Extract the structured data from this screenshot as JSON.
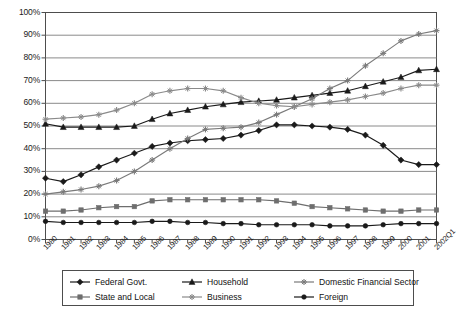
{
  "chart_data": {
    "type": "line",
    "title": "",
    "xlabel": "",
    "ylabel": "",
    "ylim": [
      0,
      100
    ],
    "ytick_labels": [
      "100%",
      "90%",
      "80%",
      "70%",
      "60%",
      "50%",
      "40%",
      "30%",
      "20%",
      "10%",
      "0%"
    ],
    "ytick_values": [
      100,
      90,
      80,
      70,
      60,
      50,
      40,
      30,
      20,
      10,
      0
    ],
    "grid": true,
    "legend_position": "bottom",
    "categories": [
      "1980",
      "1981",
      "1982",
      "1983",
      "1984",
      "1985",
      "1986",
      "1987",
      "1988",
      "1989",
      "1990",
      "1991",
      "1992",
      "1993",
      "1994",
      "1995",
      "1996",
      "1997",
      "1998",
      "1999",
      "2000",
      "2001",
      "2002Q1"
    ],
    "series": [
      {
        "name": "Federal Govt.",
        "marker": "diamond",
        "color": "#1a1a1a",
        "values": [
          27,
          25.5,
          28.5,
          32,
          35,
          38,
          41,
          42.5,
          43.5,
          44,
          44.5,
          46,
          48,
          50.5,
          50.5,
          50,
          49.5,
          48.5,
          46,
          41.5,
          35,
          33,
          33
        ]
      },
      {
        "name": "Household",
        "marker": "triangle",
        "color": "#1a1a1a",
        "values": [
          51,
          49.5,
          49.5,
          49.5,
          49.5,
          50,
          53,
          55.5,
          57,
          58.5,
          59.5,
          60.5,
          61,
          61.5,
          62.5,
          63.5,
          64.5,
          65.5,
          67.5,
          69.5,
          71.5,
          74.5,
          75
        ]
      },
      {
        "name": "Domestic Financial Sector",
        "marker": "star",
        "color": "#7a7a7a",
        "values": [
          20,
          21,
          22,
          23.5,
          26,
          30,
          35,
          40,
          44.5,
          48.5,
          49,
          49.5,
          51.5,
          55,
          58.5,
          62,
          66.5,
          70,
          76.5,
          82,
          87.5,
          90.5,
          92
        ]
      },
      {
        "name": "State and Local",
        "marker": "square",
        "color": "#6e6e6e",
        "values": [
          12.5,
          12.5,
          13,
          14,
          14.5,
          14.5,
          17,
          17.5,
          17.5,
          17.5,
          17.5,
          17.5,
          17.5,
          17,
          16,
          14.5,
          14,
          13.5,
          13,
          12.5,
          12.5,
          13,
          13
        ]
      },
      {
        "name": "Business",
        "marker": "star",
        "color": "#8a8a8a",
        "values": [
          53,
          53.5,
          54,
          55,
          57,
          60,
          64,
          65.5,
          66.5,
          66.5,
          65.5,
          62.5,
          60,
          59,
          58.5,
          59.5,
          60.5,
          61.5,
          63,
          64.5,
          66.5,
          68,
          68
        ]
      },
      {
        "name": "Foreign",
        "marker": "circle",
        "color": "#1a1a1a",
        "values": [
          8,
          7.5,
          7.5,
          7.5,
          7.5,
          7.5,
          8,
          8,
          7.5,
          7.5,
          7,
          7,
          6.5,
          6.5,
          6.5,
          6.5,
          6,
          6,
          6,
          6.5,
          7,
          7,
          7
        ]
      }
    ],
    "legend_entries": [
      "Federal Govt.",
      "Household",
      "Domestic Financial Sector",
      "State and Local",
      "Business",
      "Foreign"
    ]
  }
}
